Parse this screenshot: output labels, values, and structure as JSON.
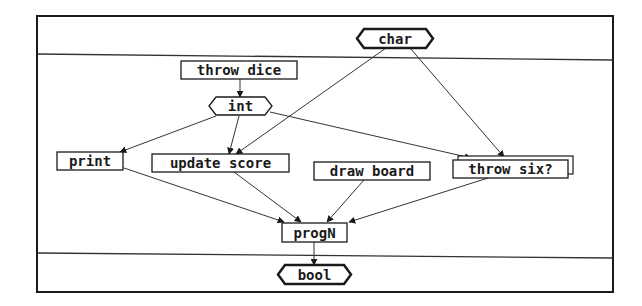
{
  "diagram": {
    "type": "dataflow",
    "frame": {
      "x": 37,
      "y": 16,
      "w": 576,
      "h": 276
    },
    "dividers": [
      {
        "x1": 37,
        "y1": 54,
        "x2": 613,
        "y2": 60
      },
      {
        "x1": 37,
        "y1": 253,
        "x2": 613,
        "y2": 258
      }
    ],
    "nodes": [
      {
        "id": "char",
        "label": "char",
        "shape": "hexagon",
        "role": "input-type",
        "x": 357,
        "y": 29,
        "w": 76,
        "h": 19
      },
      {
        "id": "throw_dice",
        "label": "throw dice",
        "shape": "box",
        "x": 181,
        "y": 61,
        "w": 116,
        "h": 18
      },
      {
        "id": "int",
        "label": "int",
        "shape": "hexagon",
        "role": "type",
        "x": 209,
        "y": 97,
        "w": 63,
        "h": 18
      },
      {
        "id": "print",
        "label": "print",
        "shape": "box",
        "x": 57,
        "y": 152,
        "w": 66,
        "h": 18
      },
      {
        "id": "update_score",
        "label": "update score",
        "shape": "box",
        "x": 152,
        "y": 154,
        "w": 137,
        "h": 18
      },
      {
        "id": "draw_board",
        "label": "draw board",
        "shape": "box",
        "x": 314,
        "y": 162,
        "w": 116,
        "h": 18
      },
      {
        "id": "throw_six",
        "label": "throw six?",
        "shape": "stacked-box",
        "x": 453,
        "y": 160,
        "w": 115,
        "h": 18
      },
      {
        "id": "progN",
        "label": "progN",
        "shape": "box",
        "x": 282,
        "y": 223,
        "w": 65,
        "h": 19
      },
      {
        "id": "bool",
        "label": "bool",
        "shape": "hexagon",
        "role": "output-type",
        "x": 278,
        "y": 265,
        "w": 73,
        "h": 19
      }
    ],
    "edges": [
      {
        "from": "throw_dice",
        "to": "int",
        "x1": 240,
        "y1": 79,
        "x2": 240,
        "y2": 97
      },
      {
        "from": "int",
        "to": "print",
        "x1": 216,
        "y1": 116,
        "x2": 120,
        "y2": 152
      },
      {
        "from": "int",
        "to": "update_score",
        "x1": 239,
        "y1": 116,
        "x2": 229,
        "y2": 154
      },
      {
        "from": "int",
        "to": "throw_six",
        "x1": 270,
        "y1": 112,
        "x2": 471,
        "y2": 158
      },
      {
        "from": "char",
        "to": "update_score",
        "x1": 386,
        "y1": 48,
        "x2": 236,
        "y2": 154
      },
      {
        "from": "char",
        "to": "throw_six",
        "x1": 410,
        "y1": 48,
        "x2": 504,
        "y2": 157
      },
      {
        "from": "print",
        "to": "progN",
        "x1": 124,
        "y1": 168,
        "x2": 284,
        "y2": 222
      },
      {
        "from": "update_score",
        "to": "progN",
        "x1": 234,
        "y1": 172,
        "x2": 301,
        "y2": 222
      },
      {
        "from": "draw_board",
        "to": "progN",
        "x1": 364,
        "y1": 180,
        "x2": 327,
        "y2": 222
      },
      {
        "from": "throw_six",
        "to": "progN",
        "x1": 488,
        "y1": 178,
        "x2": 349,
        "y2": 222
      },
      {
        "from": "progN",
        "to": "bool",
        "x1": 314,
        "y1": 242,
        "x2": 314,
        "y2": 265
      }
    ]
  }
}
